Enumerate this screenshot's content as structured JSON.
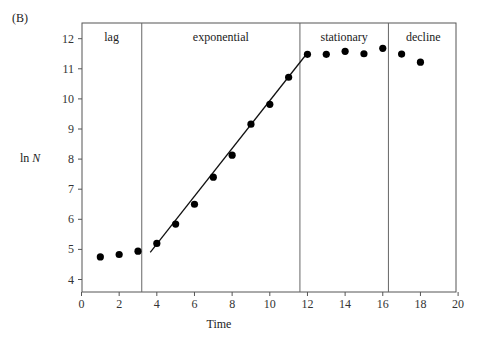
{
  "panel_label": "(B)",
  "chart_data": {
    "type": "scatter",
    "title": "",
    "xlabel": "Time",
    "ylabel": "ln N",
    "xlim": [
      0,
      20
    ],
    "ylim": [
      3.6,
      12.5
    ],
    "x_ticks": [
      0,
      2,
      4,
      6,
      8,
      10,
      12,
      14,
      16,
      18,
      20
    ],
    "y_ticks": [
      4,
      5,
      6,
      7,
      8,
      9,
      10,
      11,
      12
    ],
    "grid": false,
    "legend": null,
    "series": [
      {
        "name": "observations",
        "marker": "filled-circle",
        "x": [
          1,
          2,
          3,
          4,
          5,
          6,
          7,
          8,
          9,
          10,
          11,
          12,
          13,
          14,
          15,
          16,
          17,
          18
        ],
        "y": [
          4.75,
          4.83,
          4.94,
          5.2,
          5.84,
          6.5,
          7.4,
          8.13,
          9.16,
          9.82,
          10.72,
          11.48,
          11.48,
          11.58,
          11.5,
          11.68,
          11.49,
          11.22
        ]
      },
      {
        "name": "exponential fit",
        "type": "line",
        "x": [
          3.65,
          11.9
        ],
        "y": [
          4.9,
          11.45
        ]
      }
    ],
    "phase_dividers": [
      3.2,
      11.6,
      16.3
    ],
    "phases": [
      {
        "label": "lag",
        "x_center": 1.6
      },
      {
        "label": "exponential",
        "x_center": 7.4
      },
      {
        "label": "stationary",
        "x_center": 13.95
      },
      {
        "label": "decline",
        "x_center": 18.15
      }
    ]
  },
  "axis_labels": {
    "x": "Time",
    "y_prefix": "ln ",
    "y_var": "N"
  }
}
